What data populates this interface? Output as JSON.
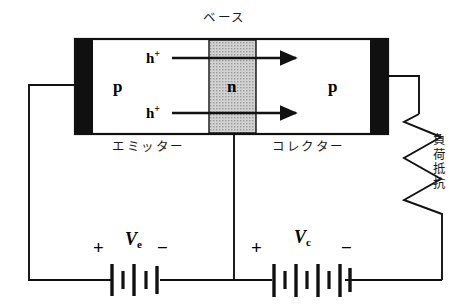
{
  "diagram": {
    "title_label": "ベース",
    "device": {
      "emitter_region_label": "p",
      "base_region_label": "n",
      "collector_region_label": "p",
      "emitter_name": "エミッター",
      "collector_name": "コレクター",
      "carrier_label_top": "h",
      "carrier_charge_top": "+",
      "carrier_label_bottom": "h",
      "carrier_charge_bottom": "+"
    },
    "load": {
      "label": "負荷抵抗"
    },
    "emitter_supply": {
      "plus_sign": "+",
      "minus_sign": "−",
      "symbol": "V",
      "subscript": "e"
    },
    "collector_supply": {
      "plus_sign": "+",
      "minus_sign": "−",
      "symbol": "V",
      "subscript": "c"
    },
    "colors": {
      "line": "#111111",
      "contact_fill": "#101010",
      "base_fill": "#c9c9c9",
      "background": "#ffffff"
    }
  }
}
